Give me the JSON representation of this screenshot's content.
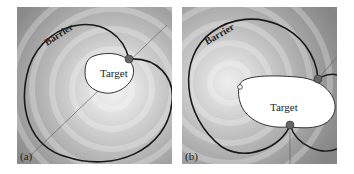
{
  "panels": [
    {
      "id": "a",
      "label": "(a)",
      "barrier_label": "Barrier",
      "target_label": "Target"
    },
    {
      "id": "b",
      "label": "(b)",
      "barrier_label": "Barrier",
      "target_label": "Target"
    }
  ],
  "colors": {
    "background_dark": "#8c8c8c",
    "background_light": "#f2f2f2",
    "barrier": "#1a1a1a",
    "point": "#555555",
    "target_fill": "#ffffff"
  }
}
